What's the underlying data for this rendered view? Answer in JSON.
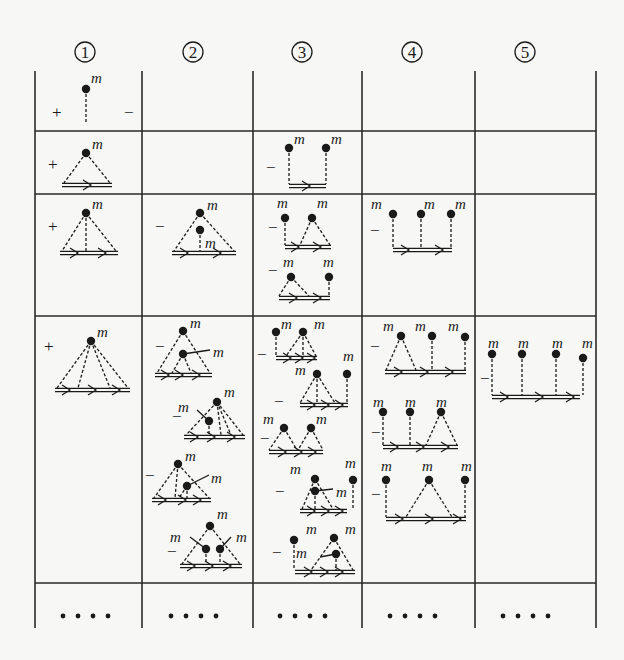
{
  "column_headers": [
    {
      "label": "1",
      "x": 85
    },
    {
      "label": "2",
      "x": 193
    },
    {
      "label": "3",
      "x": 302
    },
    {
      "label": "4",
      "x": 412
    },
    {
      "label": "5",
      "x": 525
    }
  ],
  "grid": {
    "vlines": [
      35,
      142,
      253,
      362,
      475,
      596
    ],
    "hlines": [
      131,
      194,
      316,
      583
    ],
    "top": 71,
    "bottom": 628,
    "left": 35,
    "right": 596
  },
  "continuation": {
    "glyph": "• • • •",
    "y": 616,
    "xs": [
      85,
      193,
      302,
      412,
      525
    ]
  },
  "vertex_label": "m",
  "cells": [
    {
      "row": 1,
      "col": 1,
      "sign": "+",
      "sign_x": 52,
      "sign_y": 118,
      "trailing_sign": "−",
      "trailing_x": 124,
      "trailing_y": 118,
      "diagram": {
        "type": "tadpole",
        "vertex": [
          86,
          89
        ],
        "bottom_y": 124
      }
    },
    {
      "row": 2,
      "col": 1,
      "sign": "+",
      "sign_x": 48,
      "sign_y": 170,
      "diagram": {
        "type": "fan",
        "apex": [
          86,
          153
        ],
        "base_x": [
          62,
          112
        ],
        "base_y": 185,
        "inner": [],
        "arrows": [
          88
        ]
      }
    },
    {
      "row": 2,
      "col": 3,
      "sign": "−",
      "sign_x": 266,
      "sign_y": 173,
      "diagram": {
        "type": "comb",
        "base_x": [
          289,
          326
        ],
        "base_y": 186,
        "legs": [
          [
            289,
            148
          ],
          [
            326,
            148
          ]
        ],
        "arrows": [
          307
        ]
      }
    },
    {
      "row": 3,
      "col": 1,
      "sign": "+",
      "sign_x": 48,
      "sign_y": 232,
      "diagram": {
        "type": "fan",
        "apex": [
          86,
          213
        ],
        "base_x": [
          60,
          118
        ],
        "base_y": 253,
        "inner": [
          86
        ],
        "arrows": [
          75,
          103
        ]
      }
    },
    {
      "row": 3,
      "col": 2,
      "sign": "−",
      "sign_x": 155,
      "sign_y": 232,
      "diagram": {
        "type": "fan_inner",
        "apex": [
          200,
          213
        ],
        "base_x": [
          172,
          236
        ],
        "base_y": 253,
        "inner_vertex": [
          200,
          230
        ],
        "inner_label_pos": [
          205,
          248
        ],
        "arrows": [
          185,
          218
        ]
      }
    },
    {
      "row": 3,
      "col": 3,
      "sign": "−",
      "sign_x": 268,
      "sign_y": 233,
      "diagram": {
        "type": "group",
        "parts": [
          {
            "kind": "leg",
            "at": [
              285,
              218
            ]
          },
          {
            "kind": "tri",
            "apex": [
              312,
              218
            ],
            "base_x": [
              300,
              330
            ]
          }
        ],
        "base_x": [
          285,
          331
        ],
        "base_y": 247,
        "arrows": [
          296,
          318
        ],
        "labels": [
          [
            277,
            208
          ],
          [
            317,
            208
          ]
        ]
      }
    },
    {
      "row": 3,
      "col": 3,
      "sign": "−",
      "sign_x": 268,
      "sign_y": 276,
      "diagram": {
        "type": "group",
        "parts": [
          {
            "kind": "tri",
            "apex": [
              291,
              277
            ],
            "base_x": [
              279,
              309
            ]
          },
          {
            "kind": "leg",
            "at": [
              329,
              277
            ]
          }
        ],
        "base_x": [
          279,
          330
        ],
        "base_y": 298,
        "arrows": [
          294,
          318
        ],
        "labels": [
          [
            283,
            267
          ],
          [
            323,
            267
          ]
        ]
      }
    },
    {
      "row": 3,
      "col": 4,
      "sign": "−",
      "sign_x": 370,
      "sign_y": 236,
      "diagram": {
        "type": "comb",
        "base_x": [
          393,
          452
        ],
        "base_y": 250,
        "legs": [
          [
            393,
            214
          ],
          [
            421,
            214
          ],
          [
            451,
            214
          ]
        ],
        "arrows": [
          406,
          440
        ],
        "labels": [
          [
            371,
            209
          ],
          [
            424,
            209
          ],
          [
            455,
            209
          ]
        ]
      }
    },
    {
      "row": 4,
      "col": 1,
      "sign": "+",
      "sign_x": 44,
      "sign_y": 352,
      "diagram": {
        "type": "fan",
        "apex": [
          91,
          341
        ],
        "base_x": [
          55,
          130
        ],
        "base_y": 390,
        "inner": [
          78,
          110
        ],
        "arrows": [
          67,
          93,
          117
        ]
      }
    },
    {
      "row": 4,
      "col": 2,
      "sign": "−",
      "sign_x": 155,
      "sign_y": 352,
      "diagram": {
        "type": "fan_side",
        "apex": [
          183,
          331
        ],
        "base_x": [
          155,
          212
        ],
        "base_y": 375,
        "inner_vertex": [
          183,
          354
        ],
        "side_end": [
          210,
          350
        ],
        "side_label": [
          213,
          357
        ],
        "inner_legs": [
          172,
          191
        ],
        "arrows": [
          166,
          180,
          197
        ]
      }
    },
    {
      "row": 4,
      "col": 2,
      "sign": "−",
      "sign_x": 172,
      "sign_y": 422,
      "diagram": {
        "type": "fan_cross",
        "apex": [
          217,
          402
        ],
        "base_x": [
          184,
          245
        ],
        "base_y": 437,
        "inner_vertex": [
          209,
          421
        ],
        "cross_from": [
          197,
          410
        ],
        "cross_label": [
          178,
          412
        ],
        "inner_legs": [
          221,
          231
        ],
        "arrows": [
          195,
          212,
          232
        ]
      }
    },
    {
      "row": 4,
      "col": 2,
      "sign": "−",
      "sign_x": 145,
      "sign_y": 481,
      "diagram": {
        "type": "fan_side",
        "apex": [
          178,
          464
        ],
        "base_x": [
          152,
          211
        ],
        "base_y": 500,
        "inner_vertex": [
          187,
          486
        ],
        "side_end": [
          209,
          475
        ],
        "side_label": [
          211,
          483
        ],
        "inner_legs": [
          179,
          187
        ],
        "arrows": [
          163,
          183,
          198
        ],
        "dash_mid": 175
      }
    },
    {
      "row": 4,
      "col": 2,
      "sign": "−",
      "sign_x": 167,
      "sign_y": 557,
      "diagram": {
        "type": "fan_two",
        "apex": [
          210,
          526
        ],
        "base_x": [
          180,
          242
        ],
        "base_y": 566,
        "inner_vertices": [
          [
            206,
            549
          ],
          [
            220,
            549
          ]
        ],
        "cross_left": [
          [
            190,
            537
          ],
          [
            174,
            539
          ]
        ],
        "cross_right": [
          [
            231,
            537
          ],
          [
            236,
            539
          ]
        ],
        "arrows": [
          192,
          210,
          228
        ],
        "apex_label": [
          217,
          519
        ]
      }
    },
    {
      "row": 4,
      "col": 3,
      "sign": "−",
      "sign_x": 257,
      "sign_y": 360,
      "diagram": {
        "type": "group",
        "parts": [
          {
            "kind": "leg",
            "at": [
              276,
              332
            ]
          },
          {
            "kind": "fan3",
            "apex": [
              303,
              332
            ],
            "base_x": [
              286,
              316
            ]
          }
        ],
        "base_x": [
          276,
          317
        ],
        "base_y": 358,
        "arrows": [
          288,
          300,
          312
        ],
        "labels": [
          [
            281,
            329
          ],
          [
            314,
            329
          ]
        ]
      }
    },
    {
      "row": 4,
      "col": 3,
      "sign": "−",
      "sign_x": 274,
      "sign_y": 407,
      "diagram": {
        "type": "group",
        "parts": [
          {
            "kind": "fan3",
            "apex": [
              317,
              374
            ],
            "base_x": [
              300,
              335
            ]
          },
          {
            "kind": "leg",
            "at": [
              347,
              374
            ]
          }
        ],
        "base_x": [
          300,
          348
        ],
        "base_y": 405,
        "arrows": [
          312,
          326,
          340
        ],
        "labels": [
          [
            295,
            375
          ],
          [
            343,
            361
          ]
        ]
      }
    },
    {
      "row": 4,
      "col": 3,
      "sign": "−",
      "sign_x": 260,
      "sign_y": 444,
      "diagram": {
        "type": "group",
        "parts": [
          {
            "kind": "tri",
            "apex": [
              284,
              428
            ],
            "base_x": [
              269,
              297
            ]
          },
          {
            "kind": "tri",
            "apex": [
              311,
              428
            ],
            "base_x": [
              298,
              323
            ]
          }
        ],
        "base_x": [
          269,
          323
        ],
        "base_y": 452,
        "arrows": [
          283,
          299,
          313
        ],
        "labels": [
          [
            263,
            424
          ],
          [
            316,
            424
          ]
        ]
      }
    },
    {
      "row": 4,
      "col": 3,
      "sign": "−",
      "sign_x": 275,
      "sign_y": 497,
      "diagram": {
        "type": "fan_side_leg",
        "apex": [
          315,
          479
        ],
        "base_x": [
          300,
          347
        ],
        "base_y": 511,
        "inner_vertex": [
          315,
          491
        ],
        "side_end": [
          333,
          489
        ],
        "side_label": [
          336,
          497
        ],
        "leg": [
          353,
          480
        ],
        "arrows": [
          312,
          326,
          340
        ],
        "labels": [
          [
            290,
            474
          ],
          [
            345,
            468
          ]
        ]
      }
    },
    {
      "row": 4,
      "col": 3,
      "sign": "−",
      "sign_x": 272,
      "sign_y": 558,
      "diagram": {
        "type": "leg_fan_cross",
        "leg": [
          294,
          540
        ],
        "apex": [
          334,
          538
        ],
        "base_x": [
          295,
          355
        ],
        "base_y": 572,
        "inner_vertex": [
          336,
          554
        ],
        "cross_from": [
          320,
          557
        ],
        "cross_label": [
          296,
          558
        ],
        "arrows": [
          309,
          325,
          340
        ],
        "labels": [
          [
            306,
            534
          ],
          [
            345,
            534
          ]
        ]
      }
    },
    {
      "row": 4,
      "col": 4,
      "sign": "−",
      "sign_x": 370,
      "sign_y": 352,
      "diagram": {
        "type": "group",
        "parts": [
          {
            "kind": "tri",
            "apex": [
              401,
              336
            ],
            "base_x": [
              386,
              416
            ]
          },
          {
            "kind": "leg",
            "at": [
              432,
              336
            ]
          },
          {
            "kind": "leg",
            "at": [
              465,
              337
            ]
          }
        ],
        "base_x": [
          385,
          466
        ],
        "base_y": 372,
        "arrows": [
          399,
          425,
          450
        ],
        "labels": [
          [
            383,
            331
          ],
          [
            415,
            331
          ],
          [
            448,
            331
          ]
        ]
      }
    },
    {
      "row": 4,
      "col": 4,
      "sign": "−",
      "sign_x": 371,
      "sign_y": 438,
      "diagram": {
        "type": "group",
        "parts": [
          {
            "kind": "leg",
            "at": [
              383,
              412
            ]
          },
          {
            "kind": "leg",
            "at": [
              410,
              412
            ]
          },
          {
            "kind": "tri",
            "apex": [
              441,
              412
            ],
            "base_x": [
              426,
              457
            ]
          }
        ],
        "base_x": [
          383,
          458
        ],
        "base_y": 447,
        "arrows": [
          395,
          421,
          446
        ],
        "labels": [
          [
            373,
            407
          ],
          [
            405,
            407
          ],
          [
            436,
            407
          ]
        ]
      }
    },
    {
      "row": 4,
      "col": 4,
      "sign": "−",
      "sign_x": 371,
      "sign_y": 500,
      "diagram": {
        "type": "group",
        "parts": [
          {
            "kind": "leg",
            "at": [
              386,
              480
            ]
          },
          {
            "kind": "tri",
            "apex": [
              429,
              480
            ],
            "base_x": [
              406,
              452
            ]
          },
          {
            "kind": "leg",
            "at": [
              465,
              480
            ]
          }
        ],
        "base_x": [
          386,
          466
        ],
        "base_y": 519,
        "arrows": [
          400,
          430,
          458
        ],
        "labels": [
          [
            381,
            471
          ],
          [
            422,
            471
          ],
          [
            461,
            471
          ]
        ]
      }
    },
    {
      "row": 4,
      "col": 5,
      "sign": "−",
      "sign_x": 480,
      "sign_y": 384,
      "diagram": {
        "type": "comb",
        "base_x": [
          492,
          580
        ],
        "base_y": 397,
        "legs": [
          [
            492,
            354
          ],
          [
            522,
            354
          ],
          [
            556,
            354
          ],
          [
            583,
            358
          ]
        ],
        "arrows": [
          505,
          540,
          571
        ],
        "labels": [
          [
            488,
            348
          ],
          [
            518,
            348
          ],
          [
            552,
            348
          ],
          [
            582,
            348
          ]
        ]
      }
    }
  ]
}
